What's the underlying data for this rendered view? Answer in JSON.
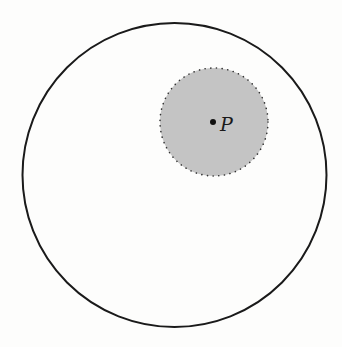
{
  "figure": {
    "outer_circle": {
      "cx": 174.5,
      "cy": 175,
      "r": 152,
      "stroke": "#1a1a1a",
      "stroke_width": 2
    },
    "inner_disk": {
      "cx": 214,
      "cy": 122,
      "r": 54,
      "fill": "#c4c4c4",
      "boundary": "dotted",
      "stroke": "#333333"
    },
    "point": {
      "label": "P",
      "x": 213,
      "y": 122
    }
  }
}
